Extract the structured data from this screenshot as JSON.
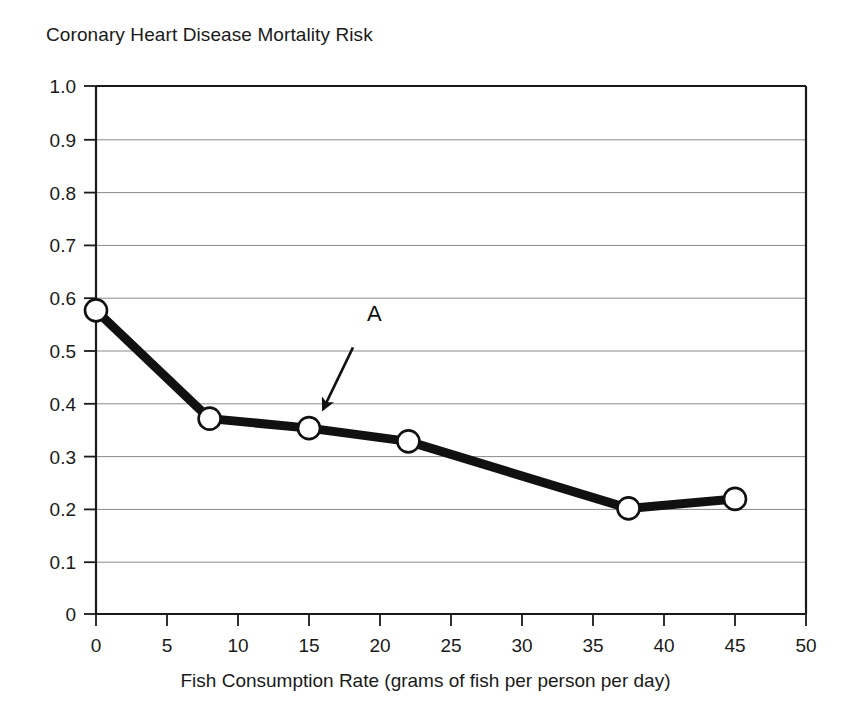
{
  "chart_data": {
    "type": "line",
    "title": "Coronary Heart Disease Mortality Risk",
    "xlabel": "Fish Consumption Rate (grams of fish per person per day)",
    "ylabel": "",
    "xlim": [
      0,
      50
    ],
    "ylim": [
      0,
      1.0
    ],
    "grid": "horizontal",
    "legend": "none",
    "xticks": [
      "0",
      "5",
      "10",
      "15",
      "20",
      "25",
      "30",
      "35",
      "40",
      "45",
      "50"
    ],
    "xtick_values": [
      0,
      5,
      10,
      15,
      20,
      25,
      30,
      35,
      40,
      45,
      50
    ],
    "yticks": [
      "0",
      "0.1",
      "0.2",
      "0.3",
      "0.4",
      "0.5",
      "0.6",
      "0.7",
      "0.8",
      "0.9",
      "1.0"
    ],
    "ytick_values": [
      0,
      0.1,
      0.2,
      0.3,
      0.4,
      0.5,
      0.6,
      0.7,
      0.8,
      0.9,
      1.0
    ],
    "series": [
      {
        "name": "Coronary Heart Disease Mortality Risk",
        "marker": "open-circle",
        "color": "#111111",
        "x": [
          0,
          8,
          15,
          22,
          37.5,
          45
        ],
        "values": [
          0.575,
          0.37,
          0.352,
          0.327,
          0.2,
          0.218
        ]
      }
    ],
    "annotations": [
      {
        "label": "A",
        "label_x": 19.6,
        "label_y": 0.555,
        "arrow_from_x": 18.1,
        "arrow_from_y": 0.505,
        "arrow_to_x": 16.0,
        "arrow_to_y": 0.388
      }
    ]
  }
}
